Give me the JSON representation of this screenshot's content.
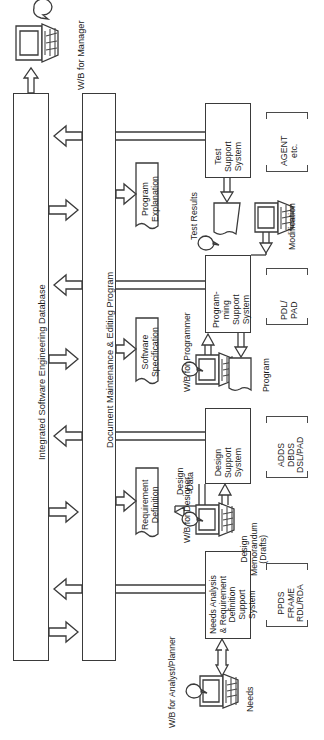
{
  "diagram": {
    "orientation": "rotated-90-ccw",
    "spines": [
      {
        "id": "db",
        "label": "Integrated Software Engineering Database"
      },
      {
        "id": "doc",
        "label": "Document Maintenance & Editing Program"
      }
    ],
    "workbenches": [
      {
        "id": "wb-manager",
        "label": "W/B for Manager"
      },
      {
        "id": "wb-programmer",
        "label": "W/B for Programmer"
      },
      {
        "id": "wb-designer",
        "label": "W/B for Designer"
      },
      {
        "id": "wb-analyst",
        "label": "W/B for Analyst/Planner"
      }
    ],
    "documents": [
      {
        "id": "doc-program-explanation",
        "label": "Program\nExplanation"
      },
      {
        "id": "doc-software-specification",
        "label": "Software\nSpecification"
      },
      {
        "id": "doc-requirement-definition",
        "label": "Requirement\nDefinition"
      }
    ],
    "systems": [
      {
        "id": "sys-test",
        "label": "Test\nSupport\nSystem",
        "tools": "AGENT\netc."
      },
      {
        "id": "sys-prog",
        "label": "Program-\nming\nSupport\nSystem",
        "tools": "PDL/\nPAD"
      },
      {
        "id": "sys-design",
        "label": "Design\nSupport\nSystem",
        "tools": "ADDS\nDBDS\nDSL/PAD"
      },
      {
        "id": "sys-needs",
        "label": "Needs Analysis\n& Requirement\nDefinition\nSupport\nSystem",
        "tools": "PPDS\nFRAME\nRDL/RDA"
      }
    ],
    "artifacts": [
      {
        "id": "art-test-results",
        "label": "Test Results"
      },
      {
        "id": "art-modification",
        "label": "Modification"
      },
      {
        "id": "art-program",
        "label": "Program"
      },
      {
        "id": "art-design-data",
        "label": "Design\nData"
      },
      {
        "id": "art-design-memo",
        "label": "Design\nMemorandum\n(Drafts)"
      },
      {
        "id": "art-needs",
        "label": "Needs"
      }
    ],
    "colors": {
      "stroke": "#3a3a3a",
      "text": "#1c1c1c",
      "background": "#ffffff"
    }
  }
}
